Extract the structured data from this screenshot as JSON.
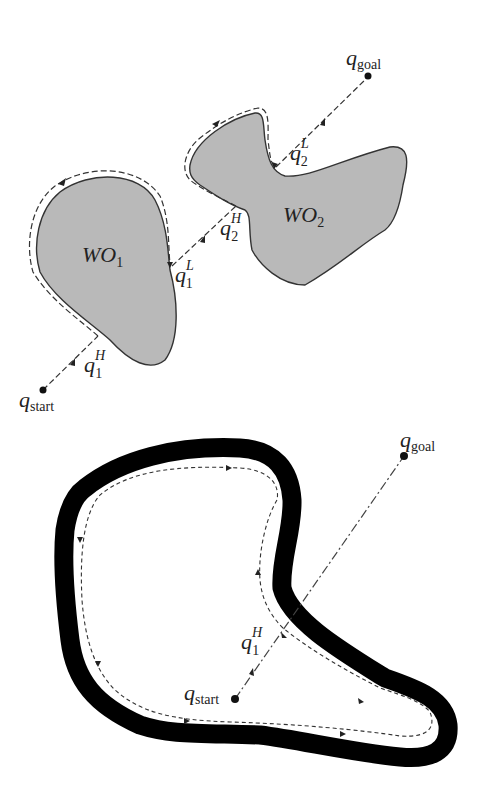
{
  "figure": {
    "top_panel": {
      "obstacles": [
        {
          "id": "WO1",
          "label_main": "WO",
          "label_sub": "1",
          "fill": "#b9b9b9"
        },
        {
          "id": "WO2",
          "label_main": "WO",
          "label_sub": "2",
          "fill": "#b9b9b9"
        }
      ],
      "points": {
        "start": {
          "main": "q",
          "sub": "start"
        },
        "goal": {
          "main": "q",
          "sub": "goal"
        },
        "q1H": {
          "main": "q",
          "sup": "H",
          "sub": "1"
        },
        "q1L": {
          "main": "q",
          "sup": "L",
          "sub": "1"
        },
        "q2H": {
          "main": "q",
          "sup": "H",
          "sub": "2"
        },
        "q2L": {
          "main": "q",
          "sup": "L",
          "sub": "2"
        }
      }
    },
    "bottom_panel": {
      "obstacle": {
        "stroke": "#000000"
      },
      "points": {
        "start": {
          "main": "q",
          "sub": "start"
        },
        "goal": {
          "main": "q",
          "sub": "goal"
        },
        "q1H": {
          "main": "q",
          "sup": "H",
          "sub": "1"
        }
      }
    }
  }
}
